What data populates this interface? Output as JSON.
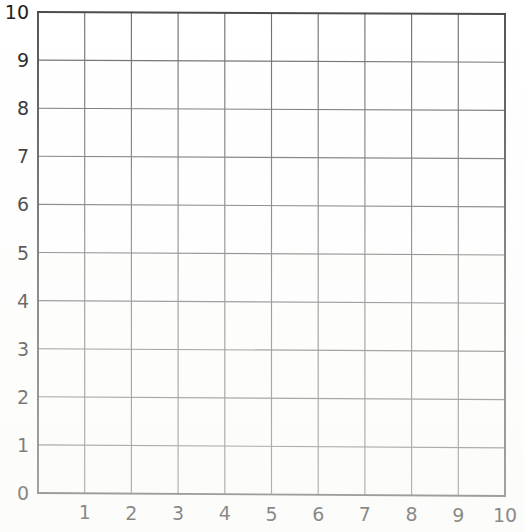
{
  "chart_data": {
    "type": "grid",
    "title": "",
    "subtitle": "",
    "xlabel": "",
    "ylabel": "",
    "xlim": [
      0,
      10
    ],
    "ylim": [
      0,
      10
    ],
    "grid": true,
    "legend": null,
    "series": [],
    "values": [],
    "categories": [],
    "annotations": [],
    "x_ticks": [
      {
        "value": 0,
        "label": "0"
      },
      {
        "value": 1,
        "label": "1"
      },
      {
        "value": 2,
        "label": "2"
      },
      {
        "value": 3,
        "label": "3"
      },
      {
        "value": 4,
        "label": "4"
      },
      {
        "value": 5,
        "label": "5"
      },
      {
        "value": 6,
        "label": "6"
      },
      {
        "value": 7,
        "label": "7"
      },
      {
        "value": 8,
        "label": "8"
      },
      {
        "value": 9,
        "label": "9"
      },
      {
        "value": 10,
        "label": "10"
      }
    ],
    "y_ticks": [
      {
        "value": 0,
        "label": "0"
      },
      {
        "value": 1,
        "label": "1"
      },
      {
        "value": 2,
        "label": "2"
      },
      {
        "value": 3,
        "label": "3"
      },
      {
        "value": 4,
        "label": "4"
      },
      {
        "value": 5,
        "label": "5"
      },
      {
        "value": 6,
        "label": "6"
      },
      {
        "value": 7,
        "label": "7"
      },
      {
        "value": 8,
        "label": "8"
      },
      {
        "value": 9,
        "label": "9"
      },
      {
        "value": 10,
        "label": "10"
      }
    ],
    "x_major_step": 1,
    "y_major_step": 1,
    "cells_x": 10,
    "cells_y": 10
  },
  "colors": {
    "background": "#ffffff",
    "grid_line": "#6e6e6e",
    "axis_line": "#4a4a4a",
    "tick_text": "#1a1a1a"
  },
  "geometry": {
    "plot_left": 38,
    "plot_right": 505,
    "plot_top": 12,
    "plot_bottom": 493,
    "canvas_width": 524,
    "canvas_height": 532
  }
}
